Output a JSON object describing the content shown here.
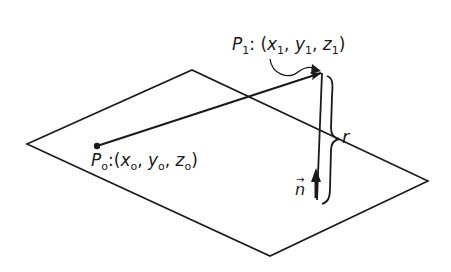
{
  "figure": {
    "ink_color": "#1a1a1a",
    "background": "#ffffff"
  },
  "labels": {
    "p1": {
      "name": "P",
      "sub": "1",
      "colon": ":",
      "open": "(",
      "x": "x",
      "x_sub": "1",
      "y": "y",
      "y_sub": "1",
      "z": "z",
      "z_sub": "1",
      "sep": ",",
      "close": ")"
    },
    "p0": {
      "name": "P",
      "sub": "o",
      "colon": ":",
      "open": "(",
      "x": "x",
      "x_sub": "o",
      "y": "y",
      "y_sub": "o",
      "z": "z",
      "z_sub": "o",
      "sep": ",",
      "close": ")"
    },
    "distance": "r",
    "normal": "n"
  }
}
